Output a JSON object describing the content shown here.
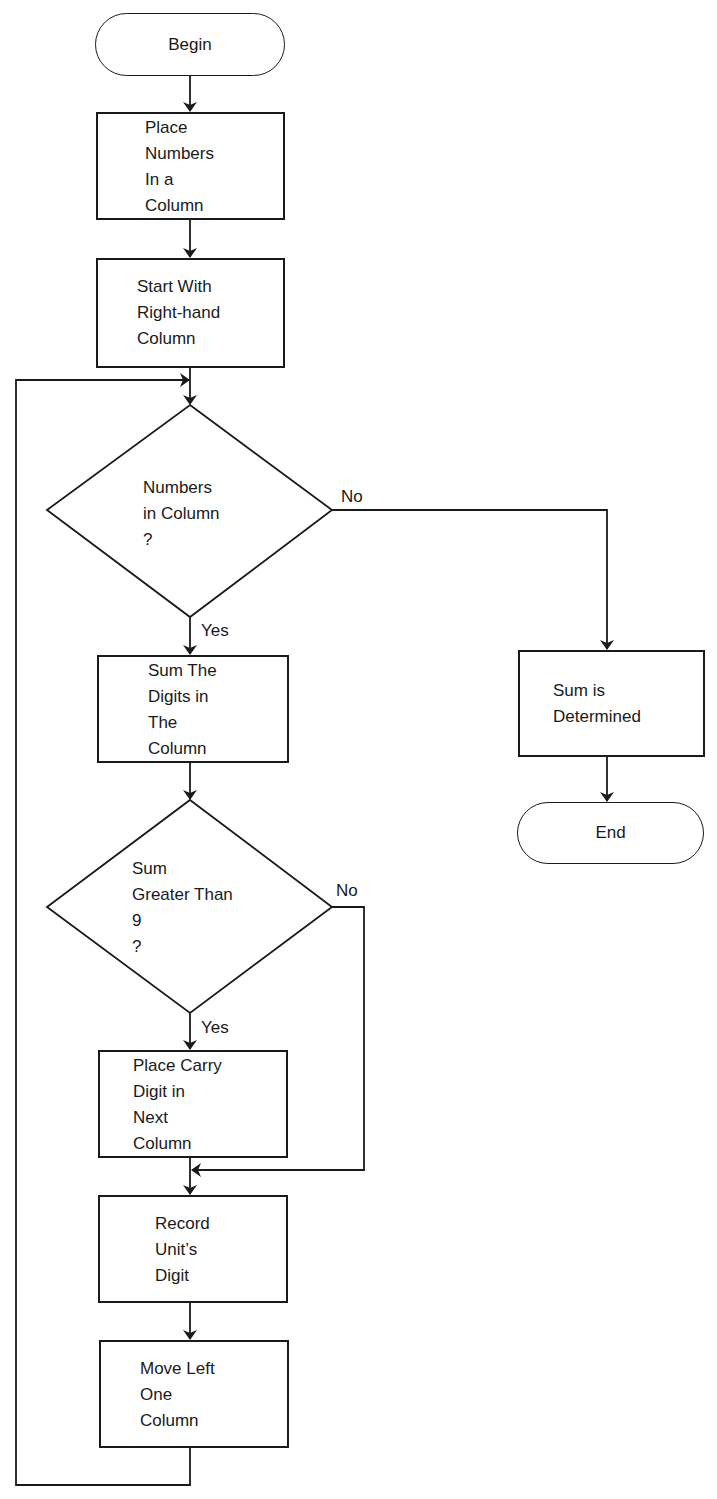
{
  "diagram": {
    "type": "flowchart",
    "nodes": {
      "begin": {
        "shape": "terminal",
        "text": "Begin"
      },
      "place_numbers": {
        "shape": "process",
        "text": "Place\nNumbers\nIn a\nColumn"
      },
      "start_right": {
        "shape": "process",
        "text": "Start With\nRight-hand\nColumn"
      },
      "numbers_in_column": {
        "shape": "decision",
        "text": "Numbers\nin Column\n?"
      },
      "sum_digits": {
        "shape": "process",
        "text": "Sum The\nDigits in\nThe\nColumn"
      },
      "sum_determined": {
        "shape": "process",
        "text": "Sum is\nDetermined"
      },
      "end": {
        "shape": "terminal",
        "text": "End"
      },
      "sum_greater_9": {
        "shape": "decision",
        "text": "Sum\nGreater Than\n9\n?"
      },
      "place_carry": {
        "shape": "process",
        "text": "Place Carry\nDigit in\nNext\nColumn"
      },
      "record_units": {
        "shape": "process",
        "text": "Record\nUnit’s\nDigit"
      },
      "move_left": {
        "shape": "process",
        "text": "Move Left\nOne\nColumn"
      }
    },
    "edge_labels": {
      "d1_no": "No",
      "d1_yes": "Yes",
      "d2_no": "No",
      "d2_yes": "Yes"
    },
    "edges": [
      {
        "from": "begin",
        "to": "place_numbers"
      },
      {
        "from": "place_numbers",
        "to": "start_right"
      },
      {
        "from": "start_right",
        "to": "numbers_in_column"
      },
      {
        "from": "numbers_in_column",
        "to": "sum_digits",
        "label": "Yes"
      },
      {
        "from": "numbers_in_column",
        "to": "sum_determined",
        "label": "No"
      },
      {
        "from": "sum_determined",
        "to": "end"
      },
      {
        "from": "sum_digits",
        "to": "sum_greater_9"
      },
      {
        "from": "sum_greater_9",
        "to": "place_carry",
        "label": "Yes"
      },
      {
        "from": "sum_greater_9",
        "to": "record_units",
        "label": "No"
      },
      {
        "from": "place_carry",
        "to": "record_units"
      },
      {
        "from": "record_units",
        "to": "move_left"
      },
      {
        "from": "move_left",
        "to": "numbers_in_column"
      }
    ],
    "colors": {
      "stroke": "#1a1a1a",
      "background": "#ffffff"
    }
  }
}
